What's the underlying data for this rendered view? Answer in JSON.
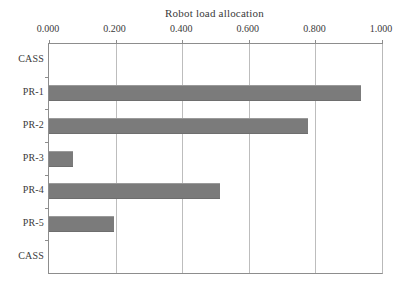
{
  "chart_data": {
    "type": "bar",
    "orientation": "horizontal",
    "title": "Robot load allocation",
    "xlabel": "",
    "ylabel": "",
    "categories": [
      "CASS",
      "PR-1",
      "PR-2",
      "PR-3",
      "PR-4",
      "PR-5",
      "CASS"
    ],
    "values": [
      0.0,
      0.937,
      0.778,
      0.072,
      0.513,
      0.195,
      0.0
    ],
    "xlim": [
      0.0,
      1.0
    ],
    "xticks": [
      0.0,
      0.2,
      0.4,
      0.6,
      0.8,
      1.0
    ],
    "xtick_labels": [
      "0.000",
      "0.200",
      "0.400",
      "0.600",
      "0.800",
      "1.000"
    ],
    "grid": "vertical",
    "x_axis_position": "top",
    "legend": "none",
    "bar_color": "#7b7b7b",
    "axis_color": "#8d8d8d",
    "gridline_color": "#bdbdbd",
    "background_color": "#ffffff"
  },
  "caption": {
    "sliver_text": ""
  }
}
